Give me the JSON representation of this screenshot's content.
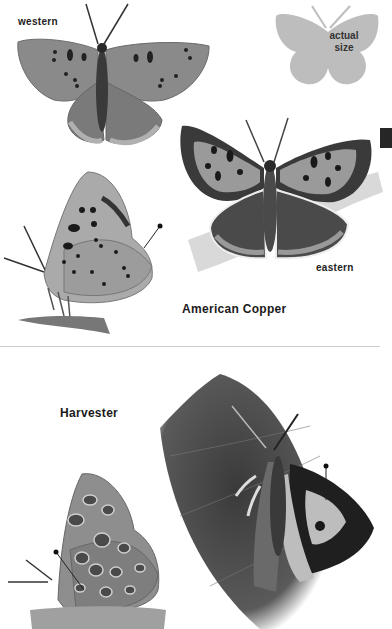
{
  "page": {
    "section_tab_color": "#262626",
    "divider_color": "#cfcfcf"
  },
  "american_copper": {
    "species_title": "American Copper",
    "labels": {
      "western": "western",
      "eastern": "eastern"
    },
    "actual_size": {
      "line1": "actual",
      "line2": "size",
      "silhouette_color": "#bdbdbd"
    },
    "figures": [
      {
        "name": "western-dorsal-view",
        "icon": "butterfly-open-wings"
      },
      {
        "name": "eastern-dorsal-view",
        "icon": "butterfly-open-wings"
      },
      {
        "name": "side-view-ventral",
        "icon": "butterfly-side-view"
      }
    ]
  },
  "harvester": {
    "species_title": "Harvester",
    "figures": [
      {
        "name": "side-view-ventral",
        "icon": "butterfly-side-view"
      },
      {
        "name": "dorsal-view-on-leaf",
        "icon": "butterfly-on-leaf"
      }
    ]
  }
}
